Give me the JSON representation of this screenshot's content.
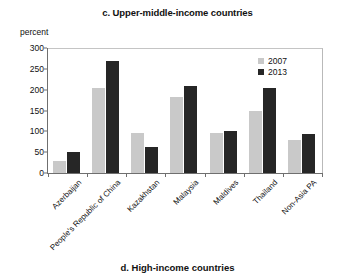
{
  "figure": {
    "title": "c. Upper-middle-income countries",
    "next_figure_caption": "d. High-income countries"
  },
  "colors": {
    "series_2007": "#c9c9c9",
    "series_2013": "#262626",
    "axis": "#6f6f6f",
    "frame": "#b9b9b9",
    "text": "#111111",
    "background": "#ffffff"
  },
  "legend": {
    "position": "top-right-inside",
    "entries": [
      {
        "label": "2007",
        "swatch": "#c9c9c9"
      },
      {
        "label": "2013",
        "swatch": "#262626"
      }
    ]
  },
  "axes": {
    "y_unit_label": "percent",
    "y_ticks": [
      "0",
      "50",
      "100",
      "150",
      "200",
      "250",
      "300"
    ],
    "x_label": ""
  },
  "chart_data": {
    "type": "bar",
    "title": "c. Upper-middle-income countries",
    "xlabel": "",
    "ylabel": "percent",
    "ylim": [
      0,
      300
    ],
    "ytick_step": 50,
    "grid": false,
    "legend_position": "upper right",
    "categories": [
      "Azerbaijan",
      "People's Republic of China",
      "Kazakhstan",
      "Malaysia",
      "Maldives",
      "Thailand",
      "Non-Asia PA"
    ],
    "series": [
      {
        "name": "2007",
        "color": "#c9c9c9",
        "values": [
          30,
          203,
          97,
          183,
          97,
          149,
          80
        ]
      },
      {
        "name": "2013",
        "color": "#262626",
        "values": [
          50,
          268,
          62,
          208,
          101,
          203,
          93
        ]
      }
    ]
  }
}
